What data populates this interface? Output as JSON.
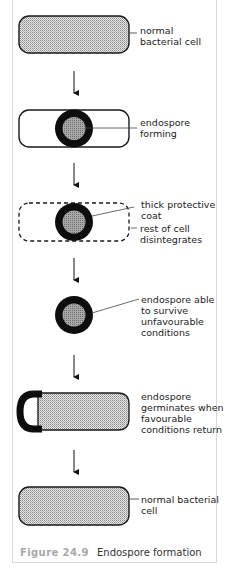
{
  "figure": {
    "number": "Figure 24.9",
    "title": "Endospore formation"
  },
  "stages": [
    {
      "id": "normal-cell",
      "label": [
        "normal",
        "bacterial cell"
      ]
    },
    {
      "id": "endospore-forming",
      "label": [
        "endospore",
        "forming"
      ]
    },
    {
      "id": "coat-and-disintegration",
      "labels": [
        {
          "text": [
            "thick protective",
            "coat"
          ]
        },
        {
          "text": [
            "rest of cell",
            "disintegrates"
          ]
        }
      ]
    },
    {
      "id": "free-endospore",
      "label": [
        "endospore able",
        "to survive",
        "unfavourable",
        "conditions"
      ]
    },
    {
      "id": "germination",
      "label": [
        "endospore",
        "germinates when",
        "favourable",
        "conditions return"
      ]
    },
    {
      "id": "normal-cell-final",
      "label": [
        "normal bacterial",
        "cell"
      ]
    }
  ],
  "colors": {
    "outline": "#1a1a1a",
    "cytoplasm_fill": "#cfcfcf",
    "spore_coat": "#0d0d0d",
    "spore_core": "#9a9a9a",
    "caption_figure": "#a8a8a8",
    "frame_border": "#d9d9d9"
  }
}
